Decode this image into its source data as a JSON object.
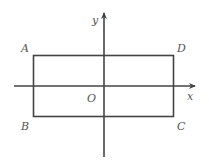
{
  "diagram": {
    "type": "coordinate-plane-rectangle",
    "axes": {
      "x_label": "x",
      "y_label": "y",
      "origin_label": "O"
    },
    "vertices": [
      {
        "label": "A",
        "position": "top-left"
      },
      {
        "label": "D",
        "position": "top-right"
      },
      {
        "label": "B",
        "position": "bottom-left"
      },
      {
        "label": "C",
        "position": "bottom-right"
      }
    ],
    "colors": {
      "stroke": "#444444",
      "text": "#555555",
      "background": "#ffffff"
    }
  }
}
